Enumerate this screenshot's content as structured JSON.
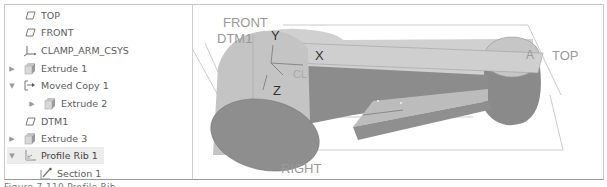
{
  "model_tree": {
    "items": [
      {
        "label": "TOP",
        "icon": "datum-plane-icon",
        "indent": 0,
        "expander": ""
      },
      {
        "label": "FRONT",
        "icon": "datum-plane-icon",
        "indent": 0,
        "expander": ""
      },
      {
        "label": "CLAMP_ARM_CSYS",
        "icon": "coordinate-system-icon",
        "indent": 0,
        "expander": ""
      },
      {
        "label": "Extrude 1",
        "icon": "extrude-icon",
        "indent": 0,
        "expander": "▶"
      },
      {
        "label": "Moved Copy 1",
        "icon": "moved-copy-icon",
        "indent": 0,
        "expander": "▼"
      },
      {
        "label": "Extrude 2",
        "icon": "extrude-icon",
        "indent": 1,
        "expander": "▶"
      },
      {
        "label": "DTM1",
        "icon": "datum-plane-icon",
        "indent": 0,
        "expander": ""
      },
      {
        "label": "Extrude 3",
        "icon": "extrude-icon",
        "indent": 0,
        "expander": "▶"
      },
      {
        "label": "Profile Rib 1",
        "icon": "profile-rib-icon",
        "indent": 0,
        "expander": "▼",
        "selected": true
      },
      {
        "label": "Section 1",
        "icon": "sketch-section-icon",
        "indent": 1,
        "expander": ""
      }
    ]
  },
  "viewport": {
    "datum_labels": {
      "front": "FRONT",
      "dtm1": "DTM1",
      "top": "TOP",
      "right": "RIGHT",
      "axis_a": "A",
      "csys_label": "CL"
    },
    "csys_axes": {
      "x": "X",
      "y": "Y",
      "z": "Z"
    }
  },
  "caption": "Figure 7-110 Profile Rib"
}
